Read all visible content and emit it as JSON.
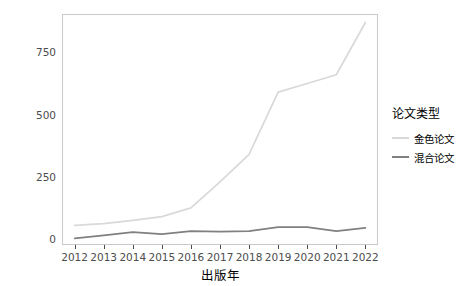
{
  "chart_data": {
    "type": "line",
    "title": "",
    "xlabel": "出版年",
    "ylabel": "APC费用（万元）",
    "x": [
      2012,
      2013,
      2014,
      2015,
      2016,
      2017,
      2018,
      2019,
      2020,
      2021,
      2022
    ],
    "categories": [
      "2012",
      "2013",
      "2014",
      "2015",
      "2016",
      "2017",
      "2018",
      "2019",
      "2020",
      "2021",
      "2022"
    ],
    "xtick_labels": [
      "2012",
      "2013",
      "2014",
      "2015",
      "2016",
      "2017",
      "2018",
      "2019",
      "2020",
      "2021",
      "2022"
    ],
    "ytick_labels": [
      "0",
      "250",
      "500",
      "750"
    ],
    "yticks": [
      0,
      250,
      500,
      750
    ],
    "ylim": [
      -20,
      900
    ],
    "xlim": [
      2011.6,
      2022.4
    ],
    "grid": false,
    "legend_position": "right",
    "legend_title": "论文类型",
    "series": [
      {
        "name": "金色论文",
        "color": "#d9d9d9",
        "values": [
          55,
          62,
          75,
          90,
          125,
          230,
          340,
          590,
          625,
          660,
          870
        ]
      },
      {
        "name": "混合论文",
        "color": "#808080",
        "values": [
          3,
          15,
          28,
          20,
          32,
          30,
          32,
          48,
          48,
          32,
          45
        ]
      }
    ]
  },
  "legend": {
    "title": "论文类型",
    "items": [
      {
        "label": "金色论文",
        "color": "#d9d9d9"
      },
      {
        "label": "混合论文",
        "color": "#808080"
      }
    ]
  },
  "axes": {
    "x_title": "出版年",
    "y_title": "APC费用（万元）",
    "y_ticks": [
      "0",
      "250",
      "500",
      "750"
    ],
    "x_ticks": [
      "2012",
      "2013",
      "2014",
      "2015",
      "2016",
      "2017",
      "2018",
      "2019",
      "2020",
      "2021",
      "2022"
    ]
  },
  "colors": {
    "panel_border": "#c9c9c9",
    "axis_text": "#4d4d4d",
    "title_text": "#000000",
    "background": "#ffffff",
    "gold_series": "#d9d9d9",
    "hybrid_series": "#808080"
  }
}
